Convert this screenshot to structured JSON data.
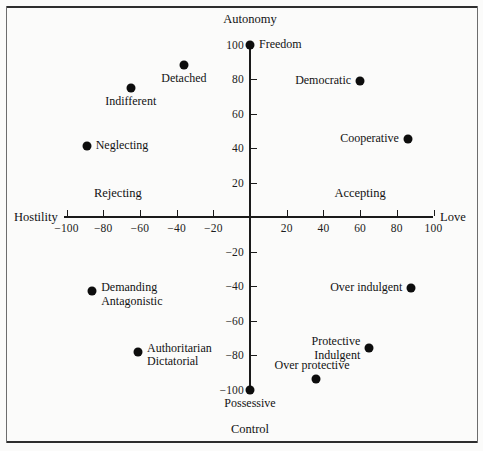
{
  "figure": {
    "background": "#fbfbfa",
    "frame_color": "#2e2e2e",
    "marker_color": "#0d0d0d"
  },
  "chart_data": {
    "type": "scatter",
    "title": "",
    "xlabel_negative": "Hostility",
    "xlabel_positive": "Love",
    "ylabel_positive": "Autonomy",
    "ylabel_negative": "Control",
    "xlim": [
      -100,
      100
    ],
    "ylim": [
      -100,
      100
    ],
    "grid": false,
    "legend": "none",
    "xticks": [
      -100,
      -80,
      -60,
      -40,
      -20,
      20,
      40,
      60,
      80,
      100
    ],
    "xticklabels": [
      "−100",
      "−80",
      "−60",
      "−40",
      "−20",
      "20",
      "40",
      "60",
      "80",
      "100"
    ],
    "yticks": [
      100,
      80,
      60,
      40,
      20,
      -20,
      -40,
      -60,
      -80,
      -100
    ],
    "yticklabels": [
      "100",
      "80",
      "60",
      "40",
      "20",
      "−20",
      "−40",
      "−60",
      "−80",
      "−100"
    ],
    "quadrant_labels": [
      {
        "text": "Rejecting",
        "x": -72,
        "y": 14
      },
      {
        "text": "Accepting",
        "x": 60,
        "y": 14
      }
    ],
    "axis_endpoints": [
      {
        "text": "Autonomy",
        "x": 0,
        "y": 116
      },
      {
        "text": "Control",
        "x": 0,
        "y": -122
      },
      {
        "text": "Hostility",
        "x": -112,
        "y": 0
      },
      {
        "text": "Love",
        "x": 112,
        "y": 0
      }
    ],
    "points": [
      {
        "label": "Freedom",
        "x": 0,
        "y": 100,
        "label_pos": "right"
      },
      {
        "label": "Detached",
        "x": -36,
        "y": 88,
        "label_pos": "below"
      },
      {
        "label": "Democratic",
        "x": 60,
        "y": 79,
        "label_pos": "left"
      },
      {
        "label": "Indifferent",
        "x": -65,
        "y": 75,
        "label_pos": "below"
      },
      {
        "label": "Cooperative",
        "x": 86,
        "y": 45,
        "label_pos": "left"
      },
      {
        "label": "Neglecting",
        "x": -89,
        "y": 41,
        "label_pos": "right"
      },
      {
        "label": "Over indulgent",
        "x": 88,
        "y": -41,
        "label_pos": "left"
      },
      {
        "label": "Demanding\nAntagonistic",
        "x": -86,
        "y": -43,
        "label_pos": "right"
      },
      {
        "label": "Protective\nIndulgent",
        "x": 65,
        "y": -76,
        "label_pos": "left"
      },
      {
        "label": "Authoritarian\nDictatorial",
        "x": -61,
        "y": -78,
        "label_pos": "right"
      },
      {
        "label": "Over protective",
        "x": 36,
        "y": -94,
        "label_pos": "above-left"
      },
      {
        "label": "Possessive",
        "x": 0,
        "y": -100,
        "label_pos": "below"
      }
    ]
  }
}
